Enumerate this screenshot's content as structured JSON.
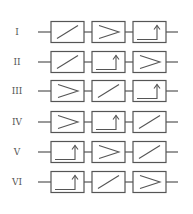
{
  "diagram": {
    "stroke_color": "#555555",
    "block_types": {
      "ramp": "diagonal-line-block",
      "comparator": "greater-than-block",
      "step": "step-arrow-block"
    },
    "rows": [
      {
        "label": "I",
        "blocks": [
          "ramp",
          "comparator",
          "step"
        ]
      },
      {
        "label": "II",
        "blocks": [
          "ramp",
          "step",
          "comparator"
        ]
      },
      {
        "label": "III",
        "blocks": [
          "comparator",
          "ramp",
          "step"
        ]
      },
      {
        "label": "IV",
        "blocks": [
          "comparator",
          "step",
          "ramp"
        ]
      },
      {
        "label": "V",
        "blocks": [
          "step",
          "comparator",
          "ramp"
        ]
      },
      {
        "label": "VI",
        "blocks": [
          "step",
          "ramp",
          "comparator"
        ]
      }
    ]
  }
}
